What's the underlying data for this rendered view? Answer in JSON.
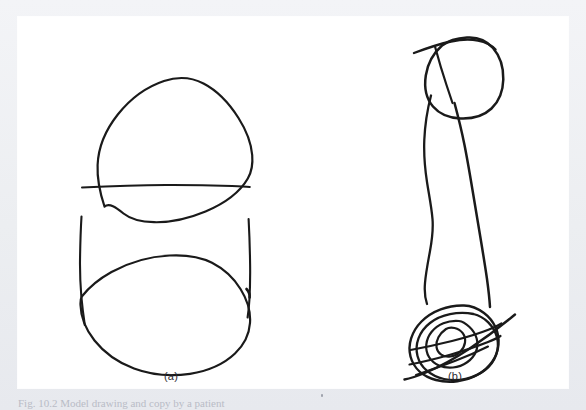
{
  "page": {
    "background_color": "#eceef1",
    "plate_color": "#ffffff",
    "ink_color": "#1a1a1a"
  },
  "figure": {
    "panels": [
      {
        "id": "a",
        "label": "(a)",
        "description": "Hand-drawn copy: a tall rectangle with a large circle overlapping its top end, a horizontal line crossing the middle, and a large circle overlapping its bottom end."
      },
      {
        "id": "b",
        "label": "(b)",
        "description": "Hand-drawn copy: a small circle at the top crossed by a diagonal line, two long wavy vertical lines descending, ending in a dense scribbled tangle of overlapping loops crossed by a diagonal line."
      }
    ],
    "caption": "Fig. 10.2  Model drawing and copy by a patient"
  }
}
